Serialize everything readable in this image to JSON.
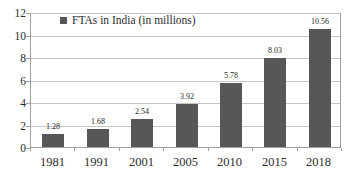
{
  "chart_data": {
    "type": "bar",
    "legend": "FTAs in India (in millions)",
    "categories": [
      "1981",
      "1991",
      "2001",
      "2005",
      "2010",
      "2015",
      "2018"
    ],
    "values": [
      1.28,
      1.68,
      2.54,
      3.92,
      5.78,
      8.03,
      10.56
    ],
    "value_labels": [
      "1.28",
      "1.68",
      "2.54",
      "3.92",
      "5.78",
      "8.03",
      "10.56"
    ],
    "ytick_labels": [
      "0",
      "2",
      "4",
      "6",
      "8",
      "10",
      "12"
    ],
    "yticks": [
      0,
      2,
      4,
      6,
      8,
      10,
      12
    ],
    "ylim": [
      0,
      12
    ],
    "grid": true,
    "legend_position": "top-left-inside",
    "colors": {
      "bar": "#575757",
      "gridline": "#c6c6c6",
      "axis": "#a0a0a0",
      "text": "#2d2d2d",
      "value_label_text": "#1f1f1f",
      "background": "#ffffff"
    }
  }
}
